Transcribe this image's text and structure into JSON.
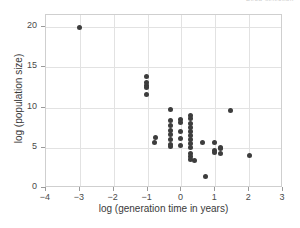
{
  "top_scrap_text": "Deca-selection",
  "colors": {
    "marker": "#3d3d3d",
    "grid": "#e2e2e2",
    "frame": "#cfcfcf",
    "text": "#3a3a3a",
    "background": "#ffffff"
  },
  "chart_data": {
    "type": "scatter",
    "title": "",
    "xlabel": "log (generation time in years)",
    "ylabel": "log (population size)",
    "xlim": [
      -4,
      3
    ],
    "ylim": [
      0,
      21.5
    ],
    "xticks": [
      -4,
      -3,
      -2,
      -1,
      0,
      1,
      2,
      3
    ],
    "xticklabels": [
      "−4",
      "−3",
      "−2",
      "−1",
      "0",
      "1",
      "2",
      "3"
    ],
    "yticks": [
      0,
      5,
      10,
      15,
      20
    ],
    "yticklabels": [
      "0",
      "5",
      "10",
      "15",
      "20"
    ],
    "grid": true,
    "legend": null,
    "marker": {
      "shape": "circle",
      "size": 5,
      "color": "#3d3d3d"
    },
    "points": [
      {
        "x": -3.0,
        "y": 20.0
      },
      {
        "x": -1.02,
        "y": 13.9
      },
      {
        "x": -1.02,
        "y": 13.1
      },
      {
        "x": -1.02,
        "y": 12.8
      },
      {
        "x": -1.02,
        "y": 12.5
      },
      {
        "x": -1.02,
        "y": 11.6
      },
      {
        "x": -0.78,
        "y": 6.3
      },
      {
        "x": -0.8,
        "y": 5.6
      },
      {
        "x": -0.33,
        "y": 9.7
      },
      {
        "x": -0.33,
        "y": 8.4
      },
      {
        "x": -0.33,
        "y": 7.8
      },
      {
        "x": -0.33,
        "y": 7.2
      },
      {
        "x": -0.33,
        "y": 6.6
      },
      {
        "x": -0.33,
        "y": 6.0
      },
      {
        "x": -0.33,
        "y": 5.4
      },
      {
        "x": -0.33,
        "y": 5.2
      },
      {
        "x": -0.02,
        "y": 8.5
      },
      {
        "x": -0.02,
        "y": 8.1
      },
      {
        "x": -0.02,
        "y": 7.0
      },
      {
        "x": -0.02,
        "y": 6.1
      },
      {
        "x": -0.02,
        "y": 5.3
      },
      {
        "x": 0.28,
        "y": 9.0
      },
      {
        "x": 0.28,
        "y": 8.6
      },
      {
        "x": 0.28,
        "y": 8.0
      },
      {
        "x": 0.28,
        "y": 7.5
      },
      {
        "x": 0.28,
        "y": 7.0
      },
      {
        "x": 0.28,
        "y": 6.5
      },
      {
        "x": 0.28,
        "y": 6.0
      },
      {
        "x": 0.28,
        "y": 5.5
      },
      {
        "x": 0.28,
        "y": 5.0
      },
      {
        "x": 0.28,
        "y": 4.3
      },
      {
        "x": 0.28,
        "y": 3.9
      },
      {
        "x": 0.28,
        "y": 3.6
      },
      {
        "x": 0.38,
        "y": 3.4
      },
      {
        "x": 0.62,
        "y": 5.7
      },
      {
        "x": 0.7,
        "y": 1.4
      },
      {
        "x": 0.98,
        "y": 5.7
      },
      {
        "x": 0.98,
        "y": 4.6
      },
      {
        "x": 0.98,
        "y": 4.4
      },
      {
        "x": 1.15,
        "y": 5.0
      },
      {
        "x": 1.15,
        "y": 4.9
      },
      {
        "x": 1.15,
        "y": 4.3
      },
      {
        "x": 1.45,
        "y": 9.6
      },
      {
        "x": 2.0,
        "y": 4.0
      }
    ]
  }
}
